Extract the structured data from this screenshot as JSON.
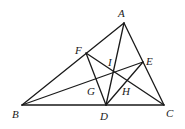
{
  "diagram": {
    "type": "geometry-triangle",
    "points": {
      "A": {
        "label": "A",
        "x": 124,
        "y": 23,
        "lx": 118,
        "ly": 17
      },
      "B": {
        "label": "B",
        "x": 22,
        "y": 105,
        "lx": 12,
        "ly": 118
      },
      "C": {
        "label": "C",
        "x": 164,
        "y": 105,
        "lx": 166,
        "ly": 117
      },
      "D": {
        "label": "D",
        "x": 106,
        "y": 105,
        "lx": 100,
        "ly": 120
      },
      "E": {
        "label": "E",
        "x": 143,
        "y": 62,
        "lx": 146,
        "ly": 65
      },
      "F": {
        "label": "F",
        "x": 86,
        "y": 53,
        "lx": 75,
        "ly": 54
      },
      "G": {
        "label": "G",
        "x": 97,
        "y": 79,
        "lx": 87,
        "ly": 95
      },
      "H": {
        "label": "H",
        "x": 130,
        "y": 83,
        "lx": 122,
        "ly": 95
      },
      "I": {
        "label": "I",
        "x": 113,
        "y": 72,
        "lx": 108,
        "ly": 66
      }
    },
    "segments": [
      [
        "A",
        "B"
      ],
      [
        "A",
        "C"
      ],
      [
        "B",
        "C"
      ],
      [
        "A",
        "D"
      ],
      [
        "B",
        "E"
      ],
      [
        "C",
        "F"
      ],
      [
        "F",
        "D"
      ],
      [
        "D",
        "E"
      ]
    ]
  }
}
